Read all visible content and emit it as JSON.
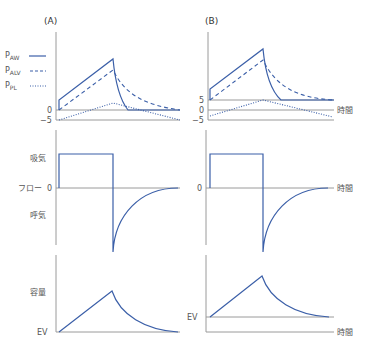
{
  "panels": {
    "a": {
      "label": "(A)"
    },
    "b": {
      "label": "(B)"
    }
  },
  "legend": [
    {
      "id": "paw",
      "main": "P",
      "sub": "AW",
      "style": "solid"
    },
    {
      "id": "palv",
      "main": "P",
      "sub": "ALV",
      "style": "dashed"
    },
    {
      "id": "ppl",
      "main": "P",
      "sub": "PL",
      "style": "dotted"
    }
  ],
  "pressure_axis": {
    "a_ticks": [
      "0",
      "−5"
    ],
    "b_ticks": [
      "5",
      "0",
      "−5"
    ]
  },
  "flow_axis": {
    "inspiration": "吸気",
    "title": "フロー",
    "zero": "0",
    "expiration": "呼気"
  },
  "volume_axis": {
    "title": "容量",
    "baseline": "EV"
  },
  "time_label": "時間",
  "colors": {
    "curve": "#3b5fa8",
    "axis": "#9a9a9a"
  }
}
